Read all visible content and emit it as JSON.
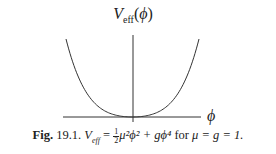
{
  "figure": {
    "y_label_main": "V",
    "y_label_sub": "eff",
    "y_label_arg": "(ϕ)",
    "x_label": "ϕ",
    "caption": {
      "label": "Fig.",
      "number": "19.1.",
      "v": "V",
      "v_sub": "eff",
      "eq": " = ",
      "frac_num": "1",
      "frac_den": "2",
      "term1": "μ²ϕ² + gϕ⁴",
      "for_text": " for ",
      "cond": "μ = g = 1."
    }
  },
  "chart_data": {
    "type": "line",
    "title": "",
    "xlabel": "ϕ",
    "ylabel": "V_eff(ϕ)",
    "function": "V_eff = (1/2) μ² ϕ² + g ϕ⁴, μ = g = 1",
    "x": [
      -1.0,
      -0.75,
      -0.5,
      -0.25,
      0,
      0.25,
      0.5,
      0.75,
      1.0
    ],
    "series": [
      {
        "name": "V_eff",
        "values": [
          1.5,
          0.598,
          0.1875,
          0.0352,
          0,
          0.0352,
          0.1875,
          0.598,
          1.5
        ]
      }
    ],
    "grid": false,
    "legend": "none",
    "caption": "Fig. 19.1. V_eff = ½μ²ϕ² + gϕ⁴ for μ = g = 1."
  }
}
